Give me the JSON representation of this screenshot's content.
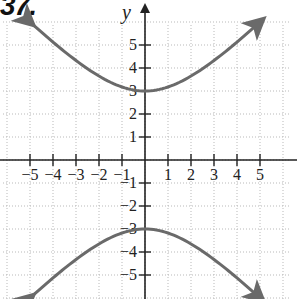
{
  "problem_label": "37.",
  "colors": {
    "curve": "#6a6a6a",
    "axis": "#222222",
    "grid": "#b9b9b9"
  },
  "chart_data": {
    "type": "line",
    "title": "",
    "xlabel": "",
    "ylabel": "y",
    "xlim": [
      -6,
      6
    ],
    "ylim": [
      -6.3,
      6.3
    ],
    "grid": true,
    "legend": null,
    "x_ticks": [
      -5,
      -4,
      -3,
      -2,
      -1,
      1,
      2,
      3,
      4,
      5
    ],
    "y_ticks": [
      -5,
      -4,
      -3,
      -2,
      -1,
      1,
      2,
      3,
      4,
      5
    ],
    "x_tick_labels": [
      "−5",
      "−4",
      "−3",
      "−2",
      "−1",
      "1",
      "2",
      "3",
      "4",
      "5"
    ],
    "y_tick_labels": [
      "−5",
      "−4",
      "−3",
      "−2",
      "−1",
      "1",
      "2",
      "3",
      "4",
      "5"
    ],
    "series": [
      {
        "name": "upper branch",
        "x": [
          -5,
          -4,
          -3,
          -2,
          -1,
          0,
          1,
          2,
          3,
          4,
          5
        ],
        "y": [
          6.0,
          5.2,
          4.4,
          3.7,
          3.2,
          3.0,
          3.2,
          3.7,
          4.4,
          5.2,
          6.0
        ],
        "arrows": "both"
      },
      {
        "name": "lower branch",
        "x": [
          -5,
          -4,
          -3,
          -2,
          -1,
          0,
          1,
          2,
          3,
          4,
          5
        ],
        "y": [
          -6.0,
          -5.2,
          -4.4,
          -3.7,
          -3.2,
          -3.0,
          -3.2,
          -3.7,
          -4.4,
          -5.2,
          -6.0
        ],
        "arrows": "both"
      }
    ],
    "annotations": [
      "vertices at (0, 3) and (0, −3)"
    ]
  }
}
